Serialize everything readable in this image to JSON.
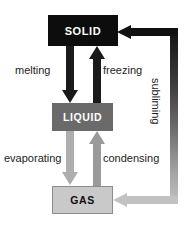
{
  "diagram": {
    "background_color": "#ffffff",
    "states": [
      {
        "id": "solid",
        "label": "SOLID",
        "fill_color": "#0d0d0d",
        "text_color": "#ffffff"
      },
      {
        "id": "liquid",
        "label": "LIQUID",
        "fill_color": "#6a6a6a",
        "text_color": "#ffffff"
      },
      {
        "id": "gas",
        "label": "GAS",
        "fill_color": "#c9c9c9",
        "border_color": "#8c8c8c",
        "text_color": "#101010"
      }
    ],
    "transitions": [
      {
        "id": "melting",
        "label": "melting",
        "from": "SOLID",
        "to": "LIQUID",
        "direction": "down",
        "arrow_color": "#1a1a1a"
      },
      {
        "id": "freezing",
        "label": "freezing",
        "from": "LIQUID",
        "to": "SOLID",
        "direction": "up",
        "arrow_color": "#1a1a1a"
      },
      {
        "id": "evaporating",
        "label": "evaporating",
        "from": "LIQUID",
        "to": "GAS",
        "direction": "down",
        "arrow_color": "#aeaeae"
      },
      {
        "id": "condensing",
        "label": "condensing",
        "from": "GAS",
        "to": "LIQUID",
        "direction": "up",
        "arrow_color": "#9a9a9a"
      },
      {
        "id": "subliming",
        "label": "subliming",
        "from": "GAS",
        "to": "SOLID",
        "direction": "bidirectional-loop-right",
        "arrow_color_top": "#111111",
        "arrow_color_bottom": "#c2c2c2",
        "orientation": "vertical"
      }
    ]
  }
}
